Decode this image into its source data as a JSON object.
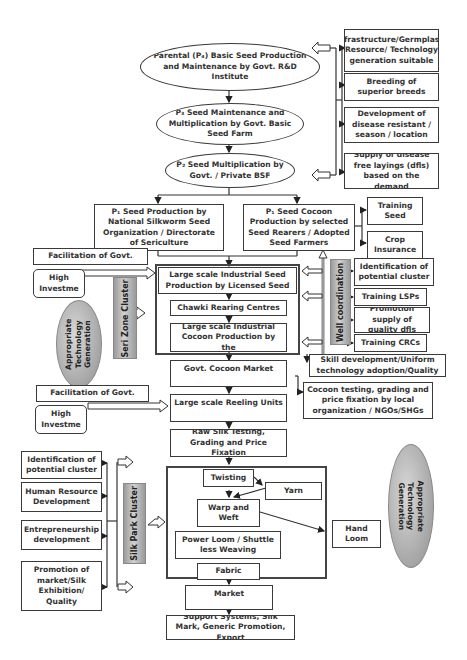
{
  "diagram": {
    "type": "flowchart",
    "seed_chain": [
      {
        "id": "p4",
        "label": "Parental (P₄) Basic Seed Production and Maintenance by Govt. R&D Institute",
        "shape": "ellipse"
      },
      {
        "id": "p3",
        "label": "P₃ Seed Maintenance and Multiplication by Govt. Basic Seed Farm",
        "shape": "ellipse"
      },
      {
        "id": "p2",
        "label": "P₂ Seed Multiplication by Govt. / Private BSF",
        "shape": "ellipse"
      },
      {
        "id": "p1a",
        "label": "P₁ Seed Production by National Silkworm Seed Organization / Directorate of Sericulture",
        "shape": "box"
      },
      {
        "id": "p1b",
        "label": "P₁ Seed Cocoon Production by selected Seed Rearers / Adopted Seed Farmers",
        "shape": "box"
      }
    ],
    "rd_support": [
      "Infrastructure/Germplasm Resource/ Technology generation suitable",
      "Breeding of superior breeds",
      "Development of disease resistant / season / location",
      "Supply of disease free layings (dfls) based on the demand"
    ],
    "seed_farmer_support": [
      "Training Seed",
      "Crop Insurance"
    ],
    "seri_zone": {
      "cluster_label": "Seri Zone Cluster",
      "facilitation": "Facilitation of Govt.",
      "high_investment": "High Investme",
      "steps": [
        "Large scale Industrial Seed Production by Licensed Seed",
        "Chawki Rearing Centres",
        "Large scale Industrial Cocoon Production by the"
      ],
      "tech_oval": "Appropriate Technology Generation"
    },
    "well_coordination": {
      "label": "Well coordination",
      "items": [
        "Identification of potential cluster",
        "Training LSPs",
        "Promotion supply of quality dfls",
        "Training CRCs"
      ]
    },
    "market_chain": {
      "cocoon_market": "Govt. Cocoon Market",
      "skill_dev": "Skill development/Uniform technology adoption/Quality",
      "cocoon_testing": "Cocoon testing, grading and price fixation by local organization / NGOs/SHGs",
      "facilitation": "Facilitation of Govt.",
      "high_investment": "High Investme",
      "reeling": "Large scale Reeling Units",
      "raw_silk": "Raw Silk Testing, Grading and Price Fixation"
    },
    "silk_park": {
      "cluster_label": "Silk Park Cluster",
      "support": [
        "Identification of potential cluster",
        "Human Resource Development",
        "Entrepreneurship development",
        "Promotion of market/Silk Exhibition/ Quality"
      ],
      "steps": {
        "twisting": "Twisting",
        "yarn": "Yarn",
        "warp_weft": "Warp and Weft",
        "power_loom": "Power Loom / Shuttle less Weaving",
        "fabric": "Fabric",
        "hand_loom": "Hand Loom"
      },
      "tech_oval": "Appropriate Technology Generation"
    },
    "end_chain": {
      "market": "Market",
      "support_systems": "Support Systems, Silk Mark, Generic Promotion, Export"
    }
  }
}
